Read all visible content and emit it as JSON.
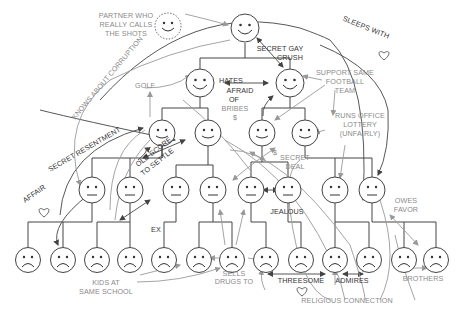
{
  "diagram": {
    "title": "",
    "labels": {
      "partner": [
        "PARTNER WHO",
        "REALLY CALLS",
        "THE SHOTS"
      ],
      "secret_gay_crush": [
        "SECRET GAY",
        "CRUSH"
      ],
      "sleeps_with": "SLEEPS WITH",
      "knows_about_corruption": "KNOWS ABOUT CORRUPTION",
      "hates": "HATES",
      "afraid_of": [
        "AFRAID",
        "OF"
      ],
      "bribes": [
        "BRIBES",
        "$"
      ],
      "golf": "GOLF",
      "support_same_team": [
        "SUPPORT SAME",
        "FOOTBALL",
        "TEAM"
      ],
      "runs_office_lottery": [
        "RUNS OFFICE",
        "LOTTERY",
        "(UNFAIRLY)"
      ],
      "secret_resentment": "SECRET RESENTMENT",
      "old_score": [
        "OLD SCORE",
        "TO SETTLE"
      ],
      "secret_deal": [
        "SECRET",
        "DEAL"
      ],
      "dollar": "$",
      "affair": "AFFAIR",
      "ex": "EX",
      "jealous": "JEALOUS",
      "owes_favor": [
        "OWES",
        "FAVOR"
      ],
      "kids_same_school": [
        "KIDS AT",
        "SAME SCHOOL"
      ],
      "sells_drugs": [
        "SELLS",
        "DRUGS TO"
      ],
      "threesome": "THREESOME",
      "admires": "ADMIRES",
      "religious_connection": "RELIGIOUS CONNECTION",
      "brothers": "BROTHERS"
    },
    "hierarchy_levels": [
      {
        "level": 0,
        "count": 1,
        "expression": "happy"
      },
      {
        "level": 1,
        "count": 2,
        "expression": "happy"
      },
      {
        "level": 2,
        "count": 4,
        "expression": "mixed"
      },
      {
        "level": 3,
        "count": 8,
        "expression": "neutral"
      },
      {
        "level": 4,
        "count": 13,
        "expression": "sad"
      }
    ],
    "colors": {
      "dark": "#333333",
      "grey": "#8a8a8a",
      "line": "#444444"
    }
  }
}
